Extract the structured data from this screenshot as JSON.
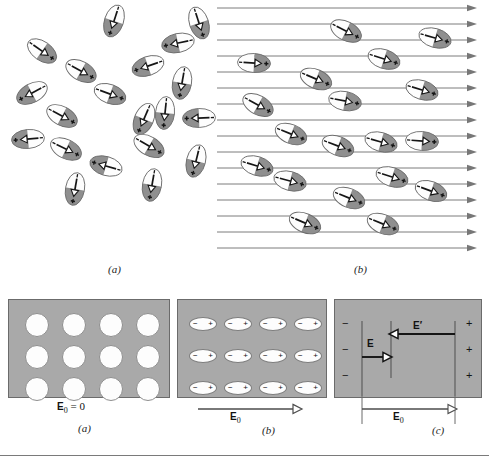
{
  "figure": {
    "colors": {
      "slab_fill": "#a9a9a9",
      "slab_border": "#6b6b6b",
      "dipole_shaded": "#8f8f8f",
      "dipole_light": "#fdfdfd",
      "line": "#6e6e6e",
      "ink": "#151515"
    }
  },
  "top": {
    "panel_a": {
      "caption": "(a)",
      "description": "randomly oriented permanent electric dipoles, no external field",
      "dipole_count": 20,
      "dipoles": [
        {
          "x": 96,
          "y": 10,
          "rot": 108
        },
        {
          "x": 24,
          "y": 40,
          "rot": 35
        },
        {
          "x": 160,
          "y": 32,
          "rot": 168
        },
        {
          "x": 181,
          "y": 12,
          "rot": 72
        },
        {
          "x": 63,
          "y": 60,
          "rot": 29
        },
        {
          "x": 130,
          "y": 55,
          "rot": 161
        },
        {
          "x": 164,
          "y": 72,
          "rot": 100
        },
        {
          "x": 14,
          "y": 82,
          "rot": 152
        },
        {
          "x": 92,
          "y": 83,
          "rot": 20
        },
        {
          "x": 44,
          "y": 105,
          "rot": 28
        },
        {
          "x": 126,
          "y": 108,
          "rot": 113
        },
        {
          "x": 147,
          "y": 102,
          "rot": 96
        },
        {
          "x": 181,
          "y": 107,
          "rot": 178
        },
        {
          "x": 10,
          "y": 128,
          "rot": 175
        },
        {
          "x": 48,
          "y": 138,
          "rot": 26
        },
        {
          "x": 131,
          "y": 135,
          "rot": 30
        },
        {
          "x": 178,
          "y": 150,
          "rot": 104
        },
        {
          "x": 88,
          "y": 155,
          "rot": 196
        },
        {
          "x": 57,
          "y": 178,
          "rot": 100
        },
        {
          "x": 134,
          "y": 174,
          "rot": 100
        }
      ]
    },
    "panel_b": {
      "caption": "(b)",
      "description": "dipoles aligned by a uniform external field pointing right",
      "field_line_count": 16,
      "field_direction": "right",
      "dipole_count": 21,
      "dipoles": [
        {
          "x": 113,
          "y": 20,
          "rot": 27
        },
        {
          "x": 202,
          "y": 27,
          "rot": 16
        },
        {
          "x": 151,
          "y": 48,
          "rot": 18
        },
        {
          "x": 21,
          "y": 52,
          "rot": 3
        },
        {
          "x": 83,
          "y": 68,
          "rot": 23
        },
        {
          "x": 189,
          "y": 79,
          "rot": 17
        },
        {
          "x": 112,
          "y": 90,
          "rot": 11
        },
        {
          "x": 25,
          "y": 94,
          "rot": 29
        },
        {
          "x": 58,
          "y": 123,
          "rot": 22
        },
        {
          "x": 105,
          "y": 135,
          "rot": 21
        },
        {
          "x": 148,
          "y": 131,
          "rot": 16
        },
        {
          "x": 189,
          "y": 130,
          "rot": 4
        },
        {
          "x": 24,
          "y": 155,
          "rot": 17
        },
        {
          "x": 57,
          "y": 170,
          "rot": 15
        },
        {
          "x": 159,
          "y": 166,
          "rot": 18
        },
        {
          "x": 116,
          "y": 187,
          "rot": 22
        },
        {
          "x": 198,
          "y": 180,
          "rot": 20
        },
        {
          "x": 72,
          "y": 212,
          "rot": 23
        },
        {
          "x": 150,
          "y": 213,
          "rot": 22
        }
      ]
    }
  },
  "bottom": {
    "panel_a": {
      "caption": "(a)",
      "field_label_bold": "E",
      "field_label_sub": "0",
      "field_label_rest": " = 0",
      "field_value": "0",
      "rows": 3,
      "cols": 4,
      "atom_state": "unpolarized",
      "atom_count": 12
    },
    "panel_b": {
      "caption": "(b)",
      "field_label_bold": "E",
      "field_label_sub": "0",
      "arrow_direction": "right",
      "rows": 3,
      "cols": 4,
      "atom_state": "polarized",
      "atom_count": 12,
      "negative_sign": "−",
      "positive_sign": "+"
    },
    "panel_c": {
      "caption": "(c)",
      "left_signs": [
        "−",
        "−",
        "−"
      ],
      "right_signs": [
        "+",
        "+",
        "+"
      ],
      "internal_field_label": "E",
      "induced_field_label": "E′",
      "external_field_label_bold": "E",
      "external_field_label_sub": "0",
      "internal_field_direction": "right",
      "induced_field_direction": "left",
      "external_field_direction": "right"
    }
  }
}
